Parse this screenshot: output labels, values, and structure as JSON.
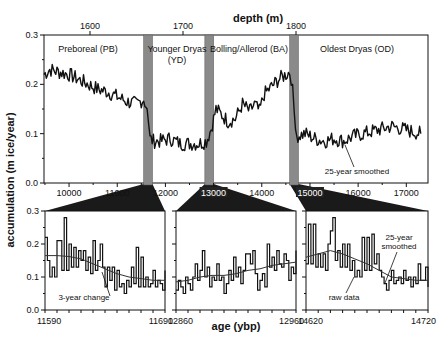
{
  "chart_data": [
    {
      "type": "line",
      "panel": "top",
      "title": "",
      "xlabel_top": "depth (m)",
      "xlabel": "age (ybp)",
      "ylabel": "accumulation (m ice/year)",
      "xlim": [
        9480,
        17450
      ],
      "ylim": [
        0.0,
        0.3
      ],
      "x_ticks": [
        10000,
        11000,
        12000,
        13000,
        14000,
        15000,
        16000,
        17000
      ],
      "x_ticks_top": [
        1600,
        1700,
        1800
      ],
      "y_ticks": [
        "0.0",
        "0.1",
        "0.2",
        "0.3"
      ],
      "periods": [
        {
          "label": "Preboreal (PB)",
          "from": 9480,
          "to": 11650
        },
        {
          "label": "Younger Dryas",
          "label2": "(YD)",
          "from": 11700,
          "to": 12900
        },
        {
          "label": "Bolling/Allerod (BA)",
          "from": 12950,
          "to": 14650
        },
        {
          "label": "Oldest Dryas (OD)",
          "from": 14700,
          "to": 17450
        }
      ],
      "transition_bands": [
        {
          "from": 11590,
          "to": 11690
        },
        {
          "from": 12860,
          "to": 12960
        },
        {
          "from": 14620,
          "to": 14720
        }
      ],
      "annotation": "25-year smoothed",
      "series": [
        {
          "name": "25-year smoothed accumulation",
          "x": [
            9480,
            9600,
            9800,
            10000,
            10200,
            10400,
            10600,
            10800,
            11000,
            11200,
            11400,
            11550,
            11620,
            11680,
            11750,
            11900,
            12100,
            12300,
            12500,
            12700,
            12850,
            12950,
            13050,
            13150,
            13300,
            13450,
            13600,
            13750,
            13850,
            13950,
            14050,
            14200,
            14350,
            14500,
            14580,
            14640,
            14700,
            14900,
            15100,
            15300,
            15500,
            15700,
            15900,
            16100,
            16300,
            16500,
            16700,
            16900,
            17100,
            17300
          ],
          "values": [
            0.22,
            0.23,
            0.225,
            0.22,
            0.21,
            0.2,
            0.19,
            0.185,
            0.175,
            0.165,
            0.16,
            0.17,
            0.15,
            0.09,
            0.085,
            0.085,
            0.09,
            0.08,
            0.08,
            0.08,
            0.085,
            0.11,
            0.15,
            0.14,
            0.125,
            0.13,
            0.16,
            0.145,
            0.16,
            0.145,
            0.18,
            0.195,
            0.21,
            0.22,
            0.225,
            0.2,
            0.095,
            0.1,
            0.09,
            0.085,
            0.09,
            0.085,
            0.095,
            0.1,
            0.105,
            0.11,
            0.115,
            0.11,
            0.105,
            0.1
          ]
        }
      ]
    },
    {
      "type": "line",
      "panel": "bottom-1",
      "xlim": [
        11590,
        11690
      ],
      "ylim": [
        0.0,
        0.3
      ],
      "x_ticks": [
        11590,
        11690
      ],
      "y_ticks": [
        "0.0",
        "0.1",
        "0.2",
        "0.3"
      ],
      "annotation": "3-year change",
      "series": [
        {
          "name": "raw data",
          "x": [
            11590,
            11592,
            11594,
            11596,
            11598,
            11600,
            11602,
            11604,
            11606,
            11608,
            11610,
            11612,
            11614,
            11616,
            11618,
            11620,
            11622,
            11624,
            11626,
            11628,
            11630,
            11632,
            11634,
            11636,
            11638,
            11640,
            11642,
            11644,
            11646,
            11648,
            11650,
            11652,
            11654,
            11656,
            11658,
            11660,
            11662,
            11664,
            11666,
            11668,
            11670,
            11672,
            11674,
            11676,
            11678,
            11680,
            11682,
            11684,
            11686,
            11688,
            11690
          ],
          "values": [
            0.22,
            0.15,
            0.1,
            0.13,
            0.1,
            0.21,
            0.21,
            0.12,
            0.28,
            0.12,
            0.2,
            0.13,
            0.19,
            0.13,
            0.18,
            0.15,
            0.18,
            0.12,
            0.16,
            0.11,
            0.21,
            0.12,
            0.15,
            0.2,
            0.13,
            0.07,
            0.13,
            0.09,
            0.13,
            0.06,
            0.12,
            0.07,
            0.08,
            0.05,
            0.09,
            0.07,
            0.13,
            0.08,
            0.19,
            0.07,
            0.16,
            0.07,
            0.1,
            0.07,
            0.08,
            0.12,
            0.07,
            0.09,
            0.08,
            0.06,
            0.12
          ]
        },
        {
          "name": "smoothed",
          "x": [
            11590,
            11600,
            11610,
            11620,
            11630,
            11640,
            11650,
            11660,
            11670,
            11680,
            11690
          ],
          "values": [
            0.165,
            0.165,
            0.162,
            0.155,
            0.14,
            0.125,
            0.11,
            0.1,
            0.095,
            0.09,
            0.09
          ]
        }
      ]
    },
    {
      "type": "line",
      "panel": "bottom-2",
      "xlim": [
        12860,
        12960
      ],
      "ylim": [
        0.0,
        0.3
      ],
      "x_ticks": [
        12860,
        12960
      ],
      "series": [
        {
          "name": "raw data",
          "x": [
            12860,
            12862,
            12864,
            12866,
            12868,
            12870,
            12872,
            12874,
            12876,
            12878,
            12880,
            12882,
            12884,
            12886,
            12888,
            12890,
            12892,
            12894,
            12896,
            12898,
            12900,
            12902,
            12904,
            12906,
            12908,
            12910,
            12912,
            12914,
            12916,
            12918,
            12920,
            12922,
            12924,
            12926,
            12928,
            12930,
            12932,
            12934,
            12936,
            12938,
            12940,
            12942,
            12944,
            12946,
            12948,
            12950,
            12952,
            12954,
            12956,
            12958,
            12960
          ],
          "values": [
            0.06,
            0.09,
            0.07,
            0.05,
            0.1,
            0.08,
            0.06,
            0.1,
            0.14,
            0.09,
            0.12,
            0.18,
            0.1,
            0.13,
            0.07,
            0.1,
            0.09,
            0.14,
            0.09,
            0.1,
            0.05,
            0.08,
            0.12,
            0.09,
            0.16,
            0.1,
            0.13,
            0.08,
            0.12,
            0.17,
            0.17,
            0.14,
            0.18,
            0.11,
            0.06,
            0.09,
            0.11,
            0.07,
            0.2,
            0.13,
            0.16,
            0.12,
            0.18,
            0.14,
            0.13,
            0.17,
            0.15,
            0.09,
            0.13,
            0.11,
            0.18
          ]
        },
        {
          "name": "smoothed",
          "x": [
            12860,
            12870,
            12880,
            12890,
            12900,
            12910,
            12920,
            12930,
            12940,
            12950,
            12960
          ],
          "values": [
            0.085,
            0.09,
            0.1,
            0.105,
            0.105,
            0.11,
            0.12,
            0.125,
            0.135,
            0.14,
            0.145
          ]
        }
      ]
    },
    {
      "type": "line",
      "panel": "bottom-3",
      "xlim": [
        14620,
        14720
      ],
      "ylim": [
        0.0,
        0.3
      ],
      "x_ticks": [
        14620,
        14720
      ],
      "annotations": [
        "25-year smoothed",
        "raw data"
      ],
      "series": [
        {
          "name": "raw data",
          "x": [
            14620,
            14622,
            14624,
            14626,
            14628,
            14630,
            14632,
            14634,
            14636,
            14638,
            14640,
            14642,
            14644,
            14646,
            14648,
            14650,
            14652,
            14654,
            14656,
            14658,
            14660,
            14662,
            14664,
            14666,
            14668,
            14670,
            14672,
            14674,
            14676,
            14678,
            14680,
            14682,
            14684,
            14686,
            14688,
            14690,
            14692,
            14694,
            14696,
            14698,
            14700,
            14702,
            14704,
            14706,
            14708,
            14710,
            14712,
            14714,
            14716,
            14718,
            14720
          ],
          "values": [
            0.14,
            0.26,
            0.14,
            0.26,
            0.13,
            0.17,
            0.13,
            0.17,
            0.12,
            0.2,
            0.24,
            0.28,
            0.15,
            0.18,
            0.13,
            0.2,
            0.13,
            0.2,
            0.12,
            0.15,
            0.1,
            0.12,
            0.1,
            0.22,
            0.12,
            0.22,
            0.12,
            0.23,
            0.14,
            0.17,
            0.12,
            0.1,
            0.08,
            0.06,
            0.09,
            0.12,
            0.08,
            0.09,
            0.1,
            0.08,
            0.12,
            0.09,
            0.1,
            0.07,
            0.1,
            0.08,
            0.14,
            0.09,
            0.09,
            0.13,
            0.07
          ]
        },
        {
          "name": "25-year smoothed",
          "x": [
            14620,
            14630,
            14640,
            14650,
            14660,
            14670,
            14680,
            14690,
            14700,
            14710,
            14720
          ],
          "values": [
            0.16,
            0.17,
            0.18,
            0.17,
            0.155,
            0.14,
            0.12,
            0.1,
            0.095,
            0.09,
            0.09
          ]
        }
      ]
    }
  ],
  "labels": {
    "depth_title": "depth (m)",
    "age_title": "age (ybp)",
    "y_title": "accumulation (m ice/year)",
    "pb": "Preboreal (PB)",
    "yd1": "Younger Dryas",
    "yd2": "(YD)",
    "ba": "Bolling/Allerod (BA)",
    "od": "Oldest Dryas (OD)",
    "smoothed_top": "25-year smoothed",
    "three_year": "3-year change",
    "smoothed_b1": "25-year",
    "smoothed_b2": "smoothed",
    "raw": "raw data"
  }
}
